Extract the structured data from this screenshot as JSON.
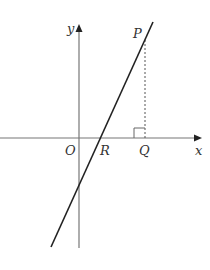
{
  "diagram": {
    "type": "coordinate-geometry",
    "colors": {
      "axis": "#777777",
      "line": "#222222",
      "dashed": "#555555",
      "label": "#333333",
      "background": "#ffffff"
    },
    "axes": {
      "x_label": "x",
      "y_label": "y"
    },
    "points": {
      "origin": "O",
      "line_x_intercept": "R",
      "foot_of_perpendicular": "Q",
      "point_on_line": "P"
    },
    "elements": [
      "x-axis with arrow",
      "y-axis with arrow",
      "straight line through R with positive gradient",
      "dashed vertical segment PQ",
      "right-angle marker at Q"
    ]
  }
}
